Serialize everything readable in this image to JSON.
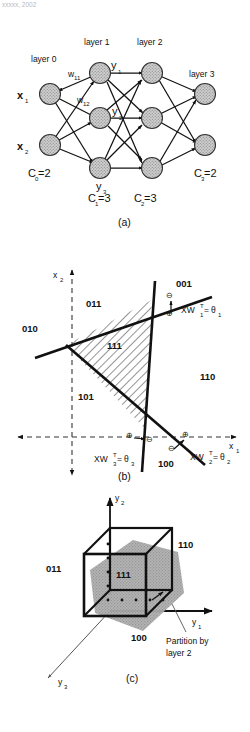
{
  "page": {
    "header_text": "xxxxx, 2002",
    "background": "#ffffff",
    "ink": "#111111",
    "node_fill": "#b5b5b5",
    "shade_fill": "#a8a8a8"
  },
  "panel_a": {
    "caption": "(a)",
    "layer_labels": [
      "layer 0",
      "layer 1",
      "layer 2",
      "layer 3"
    ],
    "input_labels": [
      "x",
      "x"
    ],
    "input_subs": [
      "1",
      "2"
    ],
    "hidden_labels": [
      "y",
      "y",
      "y"
    ],
    "hidden_subs": [
      "1",
      "2",
      "3"
    ],
    "weight_labels": [
      "w",
      "w"
    ],
    "weight_subs": [
      "11",
      "12"
    ],
    "counts": [
      {
        "label": "C",
        "sub": "0",
        "value": "=2"
      },
      {
        "label": "C",
        "sub": "1",
        "value": "=3"
      },
      {
        "label": "C",
        "sub": "2",
        "value": "=3"
      },
      {
        "label": "C",
        "sub": "3",
        "value": "=2"
      }
    ],
    "layer_sizes": [
      2,
      3,
      3,
      2
    ]
  },
  "panel_b": {
    "caption": "(b)",
    "axis_x": "x",
    "axis_x_sub": "1",
    "axis_y": "x",
    "axis_y_sub": "2",
    "region_labels": [
      "011",
      "010",
      "001",
      "110",
      "101",
      "111",
      "100"
    ],
    "line_labels": [
      {
        "prefix": "XW",
        "sub": "1",
        "sup": "T",
        "eq": "=",
        "theta": "θ",
        "theta_sub": "1"
      },
      {
        "prefix": "XW",
        "sub": "2",
        "sup": "T",
        "eq": "=",
        "theta": "θ",
        "theta_sub": "2"
      },
      {
        "prefix": "XW",
        "sub": "3",
        "sup": "T",
        "eq": "=",
        "theta": "θ",
        "theta_sub": "3"
      }
    ],
    "sign_markers": [
      "⊕",
      "⊖"
    ]
  },
  "panel_c": {
    "caption": "(c)",
    "axes": [
      {
        "label": "y",
        "sub": "1"
      },
      {
        "label": "y",
        "sub": "2"
      },
      {
        "label": "y",
        "sub": "3"
      }
    ],
    "vertex_labels": [
      "011",
      "110",
      "111",
      "100"
    ],
    "annotation_line1": "Partition by",
    "annotation_line2": "layer 2"
  }
}
